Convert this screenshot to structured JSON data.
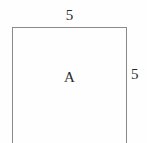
{
  "figure": {
    "type": "geometry-diagram",
    "background_color": "#fefefe",
    "stroke_color": "#8a8a8a",
    "text_color": "#2b2b2b",
    "region_label": "A",
    "labels": {
      "top_side": "5",
      "right_side": "5"
    },
    "shape": {
      "name": "square",
      "sides_labeled": 2,
      "side_length": "5",
      "bottom_edge_visible": false
    }
  }
}
